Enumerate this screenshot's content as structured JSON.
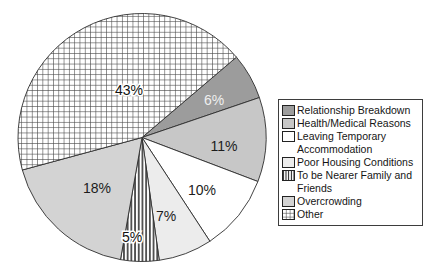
{
  "figure": {
    "background": "#ffffff",
    "title": ""
  },
  "chart_data": {
    "type": "pie",
    "title": "",
    "unit": "%",
    "legend_position": "right",
    "grid": false,
    "center": [
      142,
      137.5
    ],
    "radius": 124,
    "start_angle_deg_clockwise_from_top": 49.6,
    "slice_stroke_color": "#2e2e2e",
    "categories": [
      "Relationship Breakdown",
      "Health/Medical Reasons",
      "Leaving Temporary Accommodation",
      "Poor Housing Conditions",
      "To be Nearer Family and Friends",
      "Overcrowding",
      "Other"
    ],
    "values": [
      6,
      11,
      10,
      7,
      5,
      18,
      43
    ],
    "slices": [
      {
        "label": "Relationship Breakdown",
        "value": 6,
        "display": "6%",
        "fill": "#9c9c9c",
        "pattern": null,
        "label_color": "#efefef",
        "label_halo": false,
        "label_pos": [
          214,
          100
        ]
      },
      {
        "label": "Health/Medical Reasons",
        "value": 11,
        "display": "11%",
        "fill": "#c7c7c7",
        "pattern": null,
        "label_color": "#1c1c1c",
        "label_halo": false,
        "label_pos": [
          224,
          146
        ]
      },
      {
        "label": "Leaving Temporary Accommodation",
        "value": 10,
        "display": "10%",
        "fill": "#ffffff",
        "pattern": null,
        "label_color": "#1c1c1c",
        "label_halo": false,
        "label_pos": [
          202,
          190
        ]
      },
      {
        "label": "Poor Housing Conditions",
        "value": 7,
        "display": "7%",
        "fill": "#ececec",
        "pattern": null,
        "label_color": "#1c1c1c",
        "label_halo": false,
        "label_pos": [
          166,
          216
        ]
      },
      {
        "label": "To be Nearer Family and Friends",
        "value": 5,
        "display": "5%",
        "fill": "#ffffff",
        "pattern": "vertical-stripes",
        "label_color": "#111111",
        "label_halo": true,
        "label_pos": [
          132,
          237
        ]
      },
      {
        "label": "Overcrowding",
        "value": 18,
        "display": "18%",
        "fill": "#d3d3d3",
        "pattern": null,
        "label_color": "#1c1c1c",
        "label_halo": false,
        "label_pos": [
          97,
          188
        ]
      },
      {
        "label": "Other",
        "value": 43,
        "display": "43%",
        "fill": "#ffffff",
        "pattern": "crosshatch-grid",
        "label_color": "#111111",
        "label_halo": true,
        "label_pos": [
          129,
          90
        ]
      }
    ]
  }
}
